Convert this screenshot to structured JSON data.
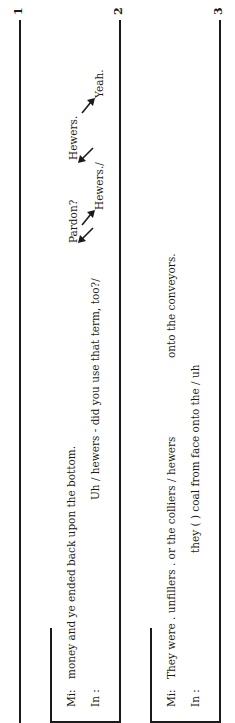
{
  "document": {
    "orientation": "rotated-90-ccw",
    "staves": [
      {
        "number": "1",
        "lines": []
      },
      {
        "number": "2",
        "lines": [
          {
            "speaker": "Mi:",
            "text": "money and ye ended back upon the bottom."
          },
          {
            "speaker": "In :",
            "text": "Uh  /  hewers - did you use that term, too?/"
          }
        ],
        "overlaps": [
          {
            "text": "Pardon?",
            "row": "upper"
          },
          {
            "text": "Hewers.",
            "row": "upper"
          },
          {
            "text": "Hewers./",
            "row": "lower"
          },
          {
            "text": "Yeah.",
            "row": "lower"
          }
        ]
      },
      {
        "number": "3",
        "lines": [
          {
            "speaker": "Mi:",
            "text": "They were . unfillers . or the colliers  /  hewers",
            "tail": "onto the conveyors."
          },
          {
            "speaker": "In :",
            "text": "they (      ) coal from face onto the  /  uh"
          }
        ]
      }
    ],
    "colors": {
      "ink": "#1a1a1a",
      "paper": "#ffffff"
    }
  }
}
